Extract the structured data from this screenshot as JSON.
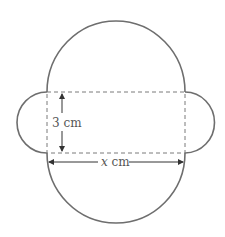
{
  "diagram": {
    "colors": {
      "outline": "#6e6e6e",
      "dashed": "#7a7a7a",
      "arrow": "#333333",
      "label": "#555555"
    },
    "rectangle": {
      "style": "dashed",
      "width_label": "x cm",
      "height_label": "3 cm"
    },
    "labels": {
      "height": "3 cm",
      "width_var": "x",
      "width_unit": " cm"
    },
    "shapes": {
      "top_semicircle": "large semicircle, diameter x",
      "bottom_semicircle": "large semicircle, diameter x",
      "left_semicircle": "small semicircle, diameter 3",
      "right_semicircle": "small semicircle, diameter 3"
    }
  }
}
